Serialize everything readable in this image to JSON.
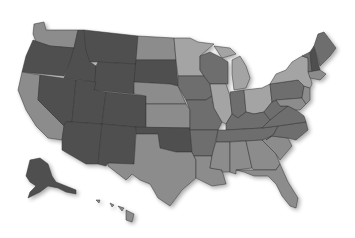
{
  "map": {
    "type": "choropleth",
    "region": "United States",
    "legend": null,
    "title": null,
    "shades": {
      "dark": "#505050",
      "medium": "#6e6e6e",
      "light": "#8c8c8c",
      "lighter": "#a4a4a4"
    },
    "states": [
      {
        "id": "WA",
        "name": "Washington",
        "shade": "light"
      },
      {
        "id": "OR",
        "name": "Oregon",
        "shade": "dark"
      },
      {
        "id": "CA",
        "name": "California",
        "shade": "light"
      },
      {
        "id": "ID",
        "name": "Idaho",
        "shade": "dark"
      },
      {
        "id": "NV",
        "name": "Nevada",
        "shade": "dark"
      },
      {
        "id": "MT",
        "name": "Montana",
        "shade": "dark"
      },
      {
        "id": "WY",
        "name": "Wyoming",
        "shade": "dark"
      },
      {
        "id": "UT",
        "name": "Utah",
        "shade": "dark"
      },
      {
        "id": "AZ",
        "name": "Arizona",
        "shade": "dark"
      },
      {
        "id": "CO",
        "name": "Colorado",
        "shade": "dark"
      },
      {
        "id": "NM",
        "name": "New Mexico",
        "shade": "dark"
      },
      {
        "id": "ND",
        "name": "North Dakota",
        "shade": "light"
      },
      {
        "id": "SD",
        "name": "South Dakota",
        "shade": "dark"
      },
      {
        "id": "NE",
        "name": "Nebraska",
        "shade": "light"
      },
      {
        "id": "KS",
        "name": "Kansas",
        "shade": "light"
      },
      {
        "id": "OK",
        "name": "Oklahoma",
        "shade": "dark"
      },
      {
        "id": "TX",
        "name": "Texas",
        "shade": "light"
      },
      {
        "id": "MN",
        "name": "Minnesota",
        "shade": "lighter"
      },
      {
        "id": "IA",
        "name": "Iowa",
        "shade": "medium"
      },
      {
        "id": "MO",
        "name": "Missouri",
        "shade": "medium"
      },
      {
        "id": "AR",
        "name": "Arkansas",
        "shade": "medium"
      },
      {
        "id": "LA",
        "name": "Louisiana",
        "shade": "light"
      },
      {
        "id": "WI",
        "name": "Wisconsin",
        "shade": "medium"
      },
      {
        "id": "IL",
        "name": "Illinois",
        "shade": "lighter"
      },
      {
        "id": "MI",
        "name": "Michigan",
        "shade": "lighter"
      },
      {
        "id": "IN",
        "name": "Indiana",
        "shade": "medium"
      },
      {
        "id": "OH",
        "name": "Ohio",
        "shade": "lighter"
      },
      {
        "id": "KY",
        "name": "Kentucky",
        "shade": "medium"
      },
      {
        "id": "TN",
        "name": "Tennessee",
        "shade": "medium"
      },
      {
        "id": "MS",
        "name": "Mississippi",
        "shade": "light"
      },
      {
        "id": "AL",
        "name": "Alabama",
        "shade": "light"
      },
      {
        "id": "GA",
        "name": "Georgia",
        "shade": "light"
      },
      {
        "id": "FL",
        "name": "Florida",
        "shade": "light"
      },
      {
        "id": "SC",
        "name": "South Carolina",
        "shade": "light"
      },
      {
        "id": "NC",
        "name": "North Carolina",
        "shade": "medium"
      },
      {
        "id": "VA",
        "name": "Virginia",
        "shade": "medium"
      },
      {
        "id": "WV",
        "name": "West Virginia",
        "shade": "medium"
      },
      {
        "id": "PA",
        "name": "Pennsylvania",
        "shade": "medium"
      },
      {
        "id": "NY",
        "name": "New York",
        "shade": "lighter"
      },
      {
        "id": "VT",
        "name": "Vermont",
        "shade": "medium"
      },
      {
        "id": "NH",
        "name": "New Hampshire",
        "shade": "dark"
      },
      {
        "id": "ME",
        "name": "Maine",
        "shade": "medium"
      },
      {
        "id": "MA",
        "name": "Massachusetts",
        "shade": "light"
      },
      {
        "id": "NJ",
        "name": "New Jersey",
        "shade": "light"
      },
      {
        "id": "MD",
        "name": "Maryland",
        "shade": "light"
      },
      {
        "id": "AK",
        "name": "Alaska",
        "shade": "dark"
      },
      {
        "id": "HI",
        "name": "Hawaii",
        "shade": "light"
      }
    ]
  }
}
